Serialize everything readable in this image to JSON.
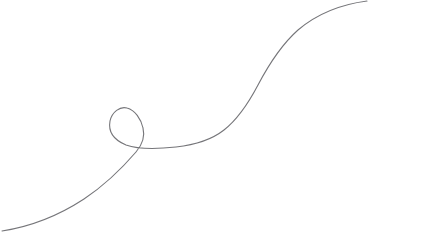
{
  "canvas": {
    "width": 426,
    "height": 252,
    "background_color": "#ffffff",
    "description": "single-continuous-line-drawing"
  },
  "drawing": {
    "name": "looped-s-curve",
    "stroke_color": "#6e6e72",
    "stroke_width": 1.1,
    "fill": "none",
    "opacity": 0.95,
    "path_d": "M 2 231 C 28 227 58 216 84 199 C 108 183 124 166 136 152 C 142 145 145 136 143 128 C 141 119 135 110 127 108 C 120 106 112 112 110 121 C 108 132 114 140 126 145 C 140 150 158 149 176 147 C 194 145 210 141 224 130 C 238 119 248 104 258 85 C 268 66 280 46 298 30 C 318 13 344 4 367 1",
    "endpoints": {
      "start": {
        "x": 2,
        "y": 231
      },
      "end": {
        "x": 367,
        "y": 1
      }
    },
    "loop": {
      "name": "curl",
      "crossing_point": {
        "x": 143,
        "y": 146
      },
      "bounds": {
        "x": 124,
        "y": 106,
        "width": 39,
        "height": 42
      }
    }
  }
}
